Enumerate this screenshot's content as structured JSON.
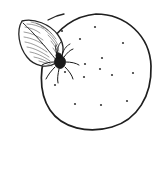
{
  "figure": {
    "background_color": "#ffffff",
    "ink_color": "#1f1f1f",
    "canvas": {
      "width": 164,
      "height": 195
    },
    "caption": ""
  },
  "subjects": {
    "fruit": {
      "name": "citrus-fruit",
      "label": "Citrus fruit",
      "fill_color": "#ffffff",
      "outline_color": "#1f1f1f",
      "center_x": 96,
      "center_y": 72,
      "radius_x": 54,
      "radius_y": 57,
      "outline_path": "M 96 14 C 126 14 150 36 151 66 C 152 96 137 120 112 127 C 88 134 62 128 50 110 C 38 92 39 64 50 44 C 58 29 74 16 96 14 Z"
    },
    "leaf": {
      "name": "leaf",
      "label": "Leaf",
      "fill_color": "#ffffff",
      "outline_color": "#262626",
      "tip_x": 22,
      "tip_y": 21,
      "base_x": 60,
      "base_y": 62,
      "blade_path": "M 22 21 C 34 18 50 24 58 35 C 66 46 64 57 56 63 C 47 69 34 66 27 57 C 19 47 16 31 22 21 Z",
      "main_vein": "M 23 23 C 33 32 45 46 57 61",
      "hatch_count": 16
    },
    "moth": {
      "name": "moth",
      "label": "Moth",
      "body_color": "#1a1a1a",
      "body_center_x": 60,
      "body_center_y": 62,
      "body_radius_x": 5.5,
      "body_radius_y": 6.5,
      "leg_count": 6,
      "antenna_count": 2,
      "wing_color": "#5f5f5f"
    },
    "stem": {
      "name": "stem",
      "label": "Stem",
      "path": "M 48 20 C 53 17 58 15 64 14"
    }
  },
  "oil_glands": {
    "name": "oil-gland-dots",
    "label": "Oil gland speckles",
    "color": "#3a3a3a",
    "radius": 1.1,
    "points": [
      {
        "x": 62,
        "y": 31
      },
      {
        "x": 95,
        "y": 27
      },
      {
        "x": 80,
        "y": 39
      },
      {
        "x": 123,
        "y": 43
      },
      {
        "x": 56,
        "y": 60
      },
      {
        "x": 85,
        "y": 64
      },
      {
        "x": 102,
        "y": 58
      },
      {
        "x": 65,
        "y": 72
      },
      {
        "x": 84,
        "y": 77
      },
      {
        "x": 112,
        "y": 75
      },
      {
        "x": 133,
        "y": 73
      },
      {
        "x": 100,
        "y": 69
      },
      {
        "x": 75,
        "y": 104
      },
      {
        "x": 101,
        "y": 105
      },
      {
        "x": 127,
        "y": 101
      },
      {
        "x": 55,
        "y": 85
      }
    ]
  },
  "leaf_hatching": {
    "name": "leaf-hatch-lines",
    "color": "#4a4a4a",
    "lines": [
      "M 25 27 C 31 28 36 30 40 33",
      "M 24 32 C 31 33 38 36 43 40",
      "M 24 37 C 31 38 39 41 45 46",
      "M 25 42 C 32 43 40 47 47 52",
      "M 27 47 C 34 48 42 52 49 57",
      "M 30 52 C 36 53 43 56 50 61",
      "M 34 57 C 39 58 45 60 51 64",
      "M 39 61 C 43 62 48 64 52 66",
      "M 27 24 C 33 24 39 26 44 29",
      "M 31 22 C 37 23 43 26 48 30",
      "M 36 23 C 42 25 48 29 52 34",
      "M 41 26 C 47 29 52 33 56 39",
      "M 45 30 C 50 34 55 39 58 45",
      "M 48 35 C 53 40 57 45 59 51",
      "M 51 41 C 55 46 58 51 59 56",
      "M 53 48 C 56 52 58 56 58 60"
    ]
  },
  "moth_legs": {
    "name": "moth-leg-lines",
    "lines": [
      "M 58 57 C 56 52 55 48 56 45",
      "M 64 57 C 67 53 70 50 73 49",
      "M 66 62 C 71 62 76 63 79 65",
      "M 65 67 C 69 71 72 75 73 79",
      "M 59 69 C 58 74 57 79 58 83",
      "M 55 67 C 51 71 48 75 46 79",
      "M 54 62 C 49 62 45 63 42 65"
    ]
  },
  "moth_antennae": {
    "name": "moth-antenna-lines",
    "lines": [
      "M 58 56 C 57 50 58 45 61 42",
      "M 62 56 C 63 50 66 46 70 44"
    ]
  },
  "legend": {
    "visible": false,
    "items": []
  }
}
